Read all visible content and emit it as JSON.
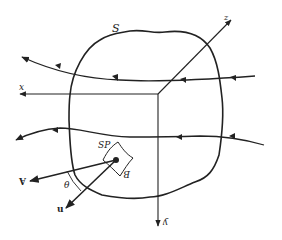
{
  "diagram": {
    "labels": {
      "surface": "S",
      "x_axis": "x",
      "z_axis": "z",
      "y_axis": "y",
      "area_element": "SP",
      "B": "B",
      "A_vector": "A",
      "u_vector": "u",
      "theta": "θ"
    },
    "colors": {
      "ink": "#222222",
      "background": "#ffffff"
    }
  }
}
